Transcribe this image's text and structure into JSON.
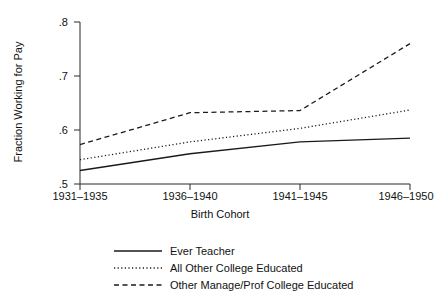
{
  "chart_data": {
    "type": "line",
    "title": "",
    "xlabel": "Birth Cohort",
    "ylabel": "Fraction Working for Pay",
    "categories": [
      "1931–1935",
      "1936–1940",
      "1941–1945",
      "1946–1950"
    ],
    "ylim": [
      0.5,
      0.8
    ],
    "yticks": [
      0.5,
      0.6,
      0.7,
      0.8
    ],
    "ytick_labels": [
      ".5",
      ".6",
      ".7",
      ".8"
    ],
    "grid": false,
    "legend_position": "bottom",
    "series": [
      {
        "name": "Ever Teacher",
        "style": "solid",
        "color": "#1a1a1a",
        "values": [
          0.525,
          0.556,
          0.578,
          0.585
        ]
      },
      {
        "name": "All Other College Educated",
        "style": "dotted",
        "color": "#1a1a1a",
        "values": [
          0.545,
          0.578,
          0.603,
          0.637
        ]
      },
      {
        "name": "Other Manage/Prof College Educated",
        "style": "dashed",
        "color": "#1a1a1a",
        "values": [
          0.573,
          0.632,
          0.636,
          0.76
        ]
      }
    ]
  },
  "axes": {
    "y_title": "Fraction Working for Pay",
    "x_title": "Birth Cohort",
    "y_tick_0": ".5",
    "y_tick_1": ".6",
    "y_tick_2": ".7",
    "y_tick_3": ".8",
    "x_tick_0": "1931–1935",
    "x_tick_1": "1936–1940",
    "x_tick_2": "1941–1945",
    "x_tick_3": "1946–1950"
  },
  "legend": {
    "items": [
      {
        "label": "Ever Teacher",
        "style": "solid"
      },
      {
        "label": "All Other College Educated",
        "style": "dotted"
      },
      {
        "label": "Other Manage/Prof College Educated",
        "style": "dashed"
      }
    ]
  }
}
